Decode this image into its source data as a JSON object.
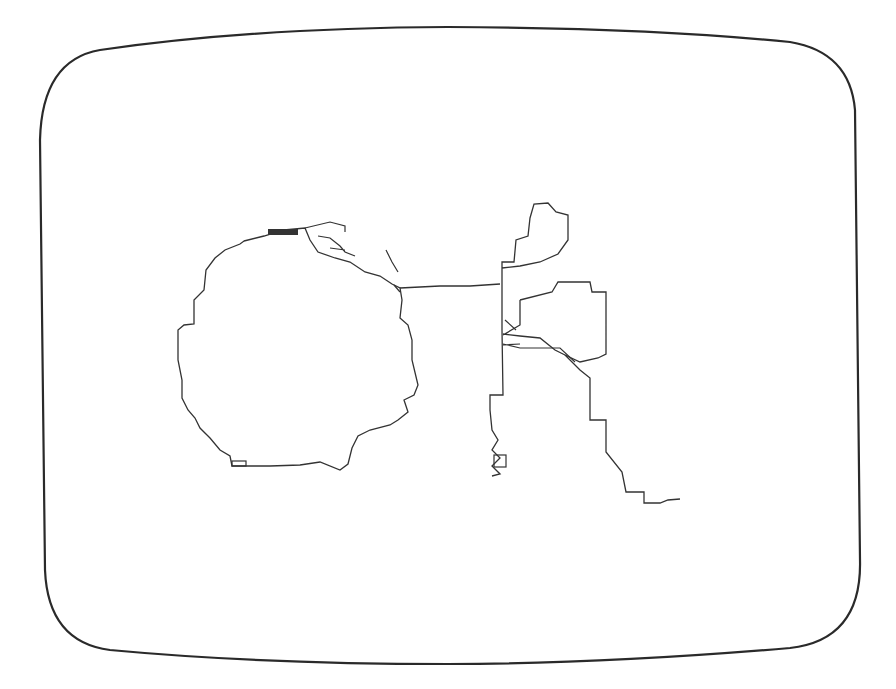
{
  "screen": {
    "background": "#ffffff",
    "frame_color": "#2a2a2a",
    "stroke_color": "#333333",
    "description": "Rounded CRT screen outline containing a jagged pixel-traced line drawing"
  },
  "drawing": {
    "wheel": {
      "cx": 297,
      "cy": 350,
      "rx": 120,
      "ry": 118
    },
    "frame_box": {
      "x": 505,
      "y": 282,
      "w": 100,
      "h": 80
    },
    "labels": []
  }
}
